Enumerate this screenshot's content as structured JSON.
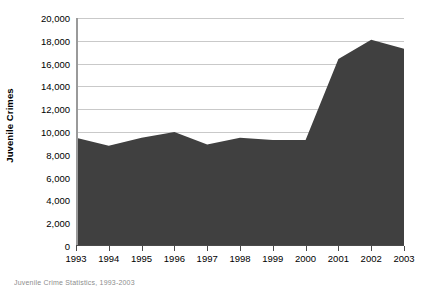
{
  "chart_data": {
    "type": "area",
    "title": "",
    "subtitle": "",
    "xlabel": "",
    "ylabel": "Juvenile Crimes",
    "categories": [
      "1993",
      "1994",
      "1995",
      "1996",
      "1997",
      "1998",
      "1999",
      "2000",
      "2001",
      "2002",
      "2003"
    ],
    "values": [
      9500,
      8800,
      9500,
      10000,
      8900,
      9500,
      9300,
      9300,
      16400,
      18100,
      17300
    ],
    "series": [
      {
        "name": "Juvenile Crimes",
        "values": [
          9500,
          8800,
          9500,
          10000,
          8900,
          9500,
          9300,
          9300,
          16400,
          18100,
          17300
        ]
      }
    ],
    "ylim": [
      0,
      20000
    ],
    "y_ticks": [
      0,
      2000,
      4000,
      6000,
      8000,
      10000,
      12000,
      14000,
      16000,
      18000,
      20000
    ],
    "y_tick_labels": [
      "0",
      "2,000",
      "4,000",
      "6,000",
      "8,000",
      "10,000",
      "12,000",
      "14,000",
      "16,000",
      "18,000",
      "20,000"
    ],
    "grid": "horizontal",
    "legend": "none",
    "area_color": "#404040",
    "gridline_color": "#c9c9c9",
    "axis_color": "#4a4a4a",
    "background_color": "#ffffff"
  },
  "figure": {
    "y_axis_title": "Juvenile Crimes",
    "caption": "Juvenile Crime Statistics, 1993-2003"
  }
}
